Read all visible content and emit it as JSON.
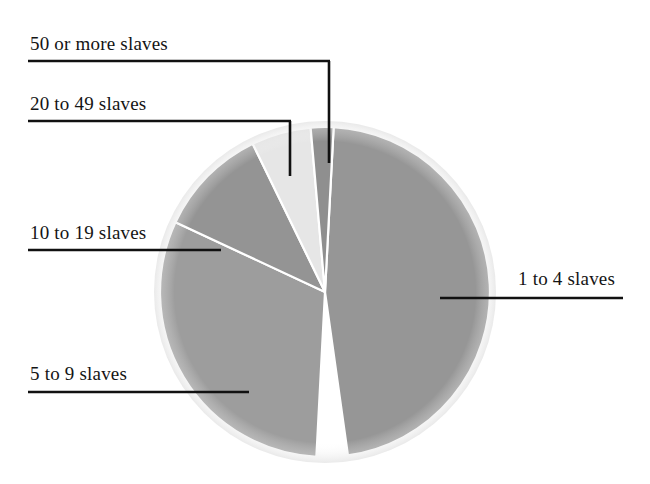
{
  "chart_data": {
    "type": "pie",
    "title": "",
    "subtitle": "",
    "xlabel": "",
    "ylabel": "",
    "legend_position": "callout-labels",
    "grid": false,
    "center": {
      "x": 325,
      "y": 292
    },
    "radius": 165,
    "start_angle_deg": 3,
    "direction": "clockwise",
    "categories": [
      "1 to 4 slaves",
      "5 to 9 slaves",
      "10 to 19 slaves",
      "20 to 49 slaves",
      "50 or more slaves"
    ],
    "values": [
      47,
      31,
      14,
      6,
      2
    ],
    "slices": [
      {
        "label": "1 to 4 slaves",
        "value": 47,
        "start_deg": 3,
        "end_deg": 172,
        "color": "#969696"
      },
      {
        "label": "5 to 9 slaves",
        "value": 31,
        "start_deg": 183,
        "end_deg": 295,
        "color": "#9d9d9d"
      },
      {
        "label": "10 to 19 slaves",
        "value": 14,
        "start_deg": 295,
        "end_deg": 334,
        "color": "#949494"
      },
      {
        "label": "20 to 49 slaves",
        "value": 6,
        "start_deg": 334,
        "end_deg": 355,
        "color": "#e6e6e6"
      },
      {
        "label": "50 or more slaves",
        "value": 2,
        "start_deg": 355,
        "end_deg": 3,
        "color": "#8f8f8f"
      }
    ],
    "wedge_separator_color": "#ffffff"
  },
  "callouts": [
    {
      "id": "fifty-or-more",
      "text": "50 or more slaves",
      "text_x": 30,
      "text_y": 50,
      "anchor": "start",
      "rule": {
        "x1": 28,
        "y1": 61,
        "x2": 330,
        "y2": 61
      },
      "stem": {
        "x1": 329,
        "y1": 61,
        "x2": 329,
        "y2": 163
      }
    },
    {
      "id": "twenty-to-fortynine",
      "text": "20 to 49 slaves",
      "text_x": 30,
      "text_y": 110,
      "anchor": "start",
      "rule": {
        "x1": 28,
        "y1": 121,
        "x2": 291,
        "y2": 121
      },
      "stem": {
        "x1": 290,
        "y1": 121,
        "x2": 290,
        "y2": 176
      }
    },
    {
      "id": "ten-to-nineteen",
      "text": "10 to 19 slaves",
      "text_x": 30,
      "text_y": 239,
      "anchor": "start",
      "rule": {
        "x1": 28,
        "y1": 250,
        "x2": 221,
        "y2": 250
      },
      "stem": null
    },
    {
      "id": "five-to-nine",
      "text": "5 to 9 slaves",
      "text_x": 30,
      "text_y": 380,
      "anchor": "start",
      "rule": {
        "x1": 28,
        "y1": 392,
        "x2": 249,
        "y2": 392
      },
      "stem": null
    },
    {
      "id": "one-to-four",
      "text": "1 to 4 slaves",
      "text_x": 518,
      "text_y": 285,
      "anchor": "start",
      "rule": {
        "x1": 440,
        "y1": 298,
        "x2": 623,
        "y2": 298
      },
      "stem": null
    }
  ],
  "style": {
    "background": "#ffffff",
    "leader_color": "#111111",
    "leader_width": 2.6,
    "text_color": "#141414"
  }
}
